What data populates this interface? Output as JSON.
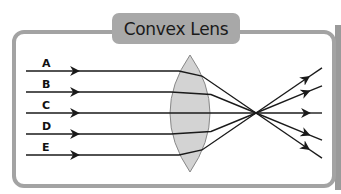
{
  "title": "Convex Lens",
  "rays": [
    {
      "label": "A",
      "y": 71
    },
    {
      "label": "B",
      "y": 92
    },
    {
      "label": "C",
      "y": 113
    },
    {
      "label": "D",
      "y": 134
    },
    {
      "label": "E",
      "y": 155
    }
  ],
  "lens": {
    "center_x": 190,
    "top_y": 55,
    "bottom_y": 172,
    "fill": "#d3d3d3",
    "stroke": "#888888"
  },
  "focal_point": {
    "x": 256,
    "y": 113
  },
  "colors": {
    "frame": "#a3a3a3",
    "title_bg": "#a8a8a8",
    "ray": "#1a1a1a"
  }
}
